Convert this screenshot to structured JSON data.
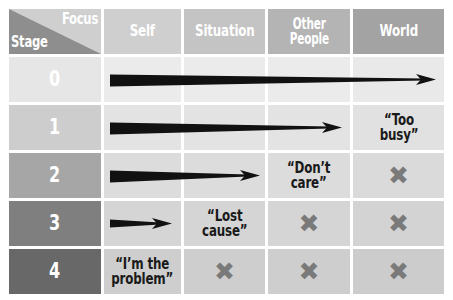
{
  "diagram": {
    "corner": {
      "focus_label": "Focus",
      "stage_label": "Stage",
      "focus_bg": "#cfcfcf",
      "stage_bg": "#8e8e8e"
    },
    "columns": [
      {
        "label": "Self",
        "bg": "#cfcfcf"
      },
      {
        "label": "Situation",
        "bg": "#c4c4c4"
      },
      {
        "label": "Other\nPeople",
        "line1": "Other",
        "line2": "People",
        "bg": "#b4b4b4"
      },
      {
        "label": "World",
        "bg": "#a3a3a3"
      }
    ],
    "rows": [
      {
        "stage": "0",
        "stage_bg": "#e6e6e6",
        "cell_bg": "#ebebeb",
        "arrow": {
          "from_col": 0,
          "to_col": 3,
          "span_label": "Self to World"
        },
        "cells": [
          {
            "type": "arrow",
            "text": ""
          },
          {
            "type": "arrow",
            "text": ""
          },
          {
            "type": "arrow",
            "text": ""
          },
          {
            "type": "arrow",
            "text": ""
          }
        ]
      },
      {
        "stage": "1",
        "stage_bg": "#cdcdcd",
        "cell_bg": "#e3e3e3",
        "arrow": {
          "from_col": 0,
          "to_col": 2,
          "span_label": "Self to Other People"
        },
        "cells": [
          {
            "type": "arrow",
            "text": ""
          },
          {
            "type": "arrow",
            "text": ""
          },
          {
            "type": "arrow",
            "text": ""
          },
          {
            "type": "quote",
            "text": "“Too\nbusy”",
            "line1": "“Too",
            "line2": "busy”"
          }
        ]
      },
      {
        "stage": "2",
        "stage_bg": "#a6a6a6",
        "cell_bg": "#dcdcdc",
        "arrow": {
          "from_col": 0,
          "to_col": 1,
          "span_label": "Self to Situation"
        },
        "cells": [
          {
            "type": "arrow",
            "text": ""
          },
          {
            "type": "arrow",
            "text": ""
          },
          {
            "type": "quote",
            "text": "“Don’t\ncare”",
            "line1": "“Don’t",
            "line2": "care”"
          },
          {
            "type": "x",
            "text": "✖"
          }
        ]
      },
      {
        "stage": "3",
        "stage_bg": "#7f7f7f",
        "cell_bg": "#d5d5d5",
        "arrow": {
          "from_col": 0,
          "to_col": 0,
          "span_label": "Self only"
        },
        "cells": [
          {
            "type": "arrow",
            "text": ""
          },
          {
            "type": "quote",
            "text": "“Lost\ncause”",
            "line1": "“Lost",
            "line2": "cause”"
          },
          {
            "type": "x",
            "text": "✖"
          },
          {
            "type": "x",
            "text": "✖"
          }
        ]
      },
      {
        "stage": "4",
        "stage_bg": "#686868",
        "cell_bg": "#cecece",
        "arrow": null,
        "cells": [
          {
            "type": "quote",
            "text": "“I’m the\nproblem”",
            "line1": "“I’m the",
            "line2": "problem”"
          },
          {
            "type": "x",
            "text": "✖"
          },
          {
            "type": "x",
            "text": "✖"
          },
          {
            "type": "x",
            "text": "✖"
          }
        ]
      }
    ],
    "colors": {
      "arrow": "#111111",
      "x_mark": "#7a7a7a",
      "header_text": "#ffffff",
      "quote_text": "#1a1a1a",
      "page_bg": "#ffffff"
    }
  }
}
